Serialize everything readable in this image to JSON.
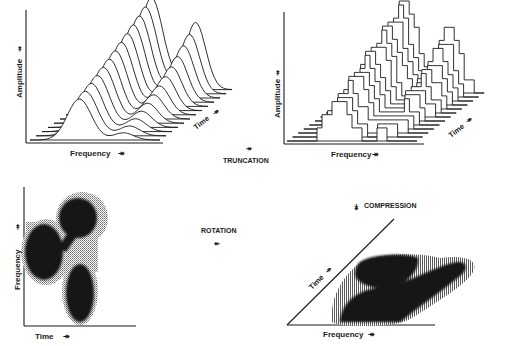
{
  "figure": {
    "panels": {
      "top_left": {
        "kind": "3d-waterfall-smooth",
        "x_label": "Frequency",
        "y_label": "Amplitude",
        "z_label": "Time",
        "arrow_glyph": "↠"
      },
      "top_right": {
        "kind": "3d-waterfall-quantized",
        "x_label": "Frequency",
        "y_label": "Amplitude",
        "z_label": "Time",
        "arrow_glyph": "↠"
      },
      "bottom_left": {
        "kind": "2d-spectrogram",
        "x_label": "Time",
        "y_label": "Frequency",
        "arrow_glyph": "↠"
      },
      "bottom_right": {
        "kind": "2d-spectrogram-sheared",
        "x_label": "Frequency",
        "diag_label": "Time",
        "arrow_glyph": "↠"
      }
    },
    "transforms": {
      "truncation": {
        "label": "TRUNCATION",
        "arrow": "↠"
      },
      "rotation": {
        "label": "ROTATION",
        "arrow": "↞"
      },
      "compression": {
        "label": "COMPRESSION",
        "arrow": "↡"
      }
    }
  }
}
